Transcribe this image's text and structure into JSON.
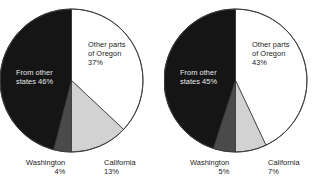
{
  "chart_data": [
    {
      "type": "pie",
      "title": "",
      "panel": "left",
      "start_angle_deg": 0,
      "direction": "clockwise",
      "categories": [
        "Other parts of Oregon",
        "California",
        "Washington",
        "From other states"
      ],
      "values": [
        37,
        13,
        4,
        46
      ],
      "value_suffix": "%",
      "colors": [
        "#ffffff",
        "#d2d2d2",
        "#4a4a4a",
        "#151515"
      ],
      "legend": "none",
      "grid": false,
      "labels": [
        {
          "name": "oregon",
          "line1": "Other parts",
          "line2": "of Oregon",
          "pct": "37%"
        },
        {
          "name": "other-states",
          "line1": "From other",
          "line2": "states 46%"
        },
        {
          "name": "washington",
          "line1": "Washington",
          "pct": "4%"
        },
        {
          "name": "california",
          "line1": "California",
          "pct": "13%"
        }
      ]
    },
    {
      "type": "pie",
      "title": "",
      "panel": "right",
      "start_angle_deg": 0,
      "direction": "clockwise",
      "categories": [
        "Other parts of Oregon",
        "California",
        "Washington",
        "From other states"
      ],
      "values": [
        43,
        7,
        5,
        45
      ],
      "value_suffix": "%",
      "colors": [
        "#ffffff",
        "#d2d2d2",
        "#4a4a4a",
        "#151515"
      ],
      "legend": "none",
      "grid": false,
      "labels": [
        {
          "name": "oregon",
          "line1": "Other parts",
          "line2": "of Oregon",
          "pct": "43%"
        },
        {
          "name": "other-states",
          "line1": "From other",
          "line2": "states 45%"
        },
        {
          "name": "washington",
          "line1": "Washington",
          "pct": "5%"
        },
        {
          "name": "california",
          "line1": "California",
          "pct": "7%"
        }
      ]
    }
  ],
  "left": {
    "oregon_line1": "Other parts",
    "oregon_line2": "of Oregon",
    "oregon_pct": "37%",
    "other_line1": "From other",
    "other_line2": "states 46%",
    "washington_label": "Washington",
    "washington_pct": "4%",
    "california_label": "California",
    "california_pct": "13%"
  },
  "right": {
    "oregon_line1": "Other parts",
    "oregon_line2": "of Oregon",
    "oregon_pct": "43%",
    "other_line1": "From other",
    "other_line2": "states 45%",
    "washington_label": "Washington",
    "washington_pct": "5%",
    "california_label": "California",
    "california_pct": "7%"
  },
  "palette": {
    "oregon": "#ffffff",
    "california": "#d2d2d2",
    "washington": "#4a4a4a",
    "other_states": "#151515",
    "outline": "#3c3c3c",
    "text_dark": "#1a1a1a",
    "text_light": "#e8e8e8",
    "background": "#ffffff"
  }
}
